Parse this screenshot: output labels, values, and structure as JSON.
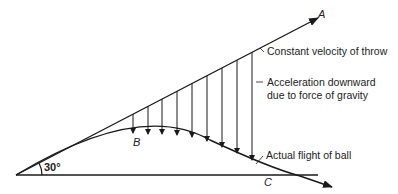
{
  "diagram": {
    "labels": {
      "point_a": "A",
      "point_b": "B",
      "point_c": "C",
      "angle": "30°",
      "constant_velocity": "Constant velocity of throw",
      "acceleration_line1": "Acceleration downward",
      "acceleration_line2": "due to force of gravity",
      "actual_flight": "Actual flight of ball"
    },
    "colors": {
      "stroke": "#1a1a1a",
      "text": "#222222"
    },
    "launch_angle_deg": 30,
    "gravity_arrow_count": 9
  }
}
